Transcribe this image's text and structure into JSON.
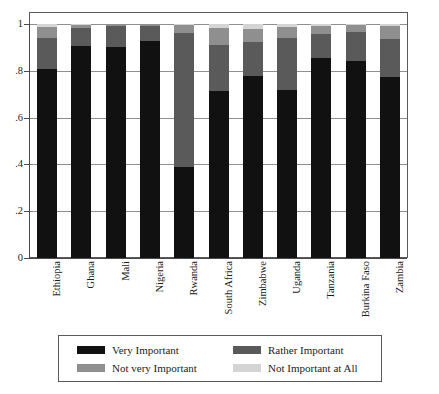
{
  "chart_data": {
    "type": "bar",
    "subtype": "stacked-bar-100-percent",
    "title": "",
    "subtitle": "",
    "xlabel": "",
    "ylabel": "",
    "ylim": [
      0,
      1
    ],
    "yticks": [
      "0",
      ".2",
      ".4",
      ".6",
      ".8",
      "1"
    ],
    "ytick_values": [
      0,
      0.2,
      0.4,
      0.6,
      0.8,
      1
    ],
    "grid": true,
    "grid_axis": "y",
    "legend_position": "bottom",
    "legend_columns": 2,
    "categories": [
      "Ethiopia",
      "Ghana",
      "Mali",
      "Nigeria",
      "Rwanda",
      "South Africa",
      "Zimbabwe",
      "Uganda",
      "Tanzania",
      "Burkina Faso",
      "Zambia"
    ],
    "series": [
      {
        "name": "Very Important",
        "color": "#111111",
        "values": [
          0.808,
          0.908,
          0.902,
          0.928,
          0.389,
          0.714,
          0.779,
          0.716,
          0.853,
          0.843,
          0.772
        ]
      },
      {
        "name": "Rather Important",
        "color": "#5a5a5a",
        "values": [
          0.132,
          0.074,
          0.089,
          0.064,
          0.571,
          0.196,
          0.146,
          0.224,
          0.106,
          0.121,
          0.164
        ]
      },
      {
        "name": "Not very Important",
        "color": "#8f8f8f",
        "values": [
          0.046,
          0.014,
          0.009,
          0.008,
          0.036,
          0.075,
          0.055,
          0.048,
          0.033,
          0.03,
          0.056
        ]
      },
      {
        "name": "Not Important at All",
        "color": "#d4d4d4",
        "values": [
          0.014,
          0.004,
          0.0,
          0.0,
          0.004,
          0.015,
          0.02,
          0.012,
          0.008,
          0.006,
          0.008
        ]
      }
    ]
  },
  "legend": {
    "items": [
      {
        "label": "Very Important",
        "color": "#111111",
        "swatch": "legend-swatch-very-important"
      },
      {
        "label": "Rather Important",
        "color": "#5a5a5a",
        "swatch": "legend-swatch-rather-important"
      },
      {
        "label": "Not very Important",
        "color": "#8f8f8f",
        "swatch": "legend-swatch-not-very-important"
      },
      {
        "label": "Not Important at All",
        "color": "#d4d4d4",
        "swatch": "legend-swatch-not-important-at-all"
      }
    ]
  },
  "style": {
    "frame_color": "#5a5a5a",
    "grid_color": "#8f8f8f",
    "axis_color": "#4a4a4a",
    "text_color": "#1c1c1c",
    "background": "#ffffff"
  }
}
